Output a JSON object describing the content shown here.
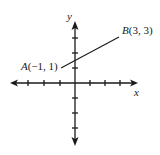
{
  "diagram": {
    "type": "coordinate-plane-line-segment",
    "axes": {
      "x_label": "x",
      "y_label": "y",
      "x_ticks_negative": 4,
      "x_ticks_positive": 4,
      "y_ticks_positive": 4,
      "y_ticks_negative": 4
    },
    "points": [
      {
        "name": "A",
        "coords": "(−1, 1)",
        "x": -1,
        "y": 1
      },
      {
        "name": "B",
        "coords": "(3, 3)",
        "x": 3,
        "y": 3
      }
    ],
    "segment": {
      "from": "A",
      "to": "B"
    },
    "colors": {
      "ink": "#1a1a1a",
      "background": "#ffffff"
    }
  }
}
